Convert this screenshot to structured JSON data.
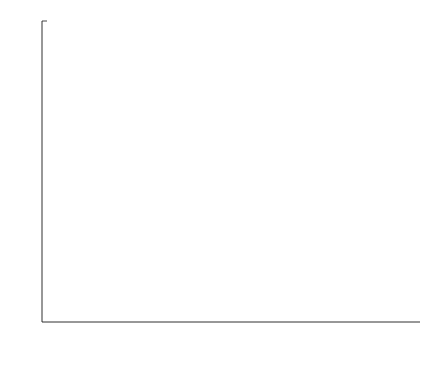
{
  "chart_data": {
    "type": "line",
    "title": "",
    "xlabel": "Signal-to-noise ratio Eb/N0",
    "ylabel": "Error rate",
    "xlim": [
      0,
      6
    ],
    "ylim": [
      1e-08,
      1
    ],
    "yscale": "log",
    "grid": false,
    "legend_position": "top-right",
    "xticks": [
      "0",
      "1",
      "2",
      "3",
      "4",
      "5",
      "6"
    ],
    "xtick_values": [
      0,
      1,
      2,
      3,
      4,
      5,
      6
    ],
    "yticks": [
      "10^0",
      "10^-1",
      "10^-2",
      "10^-3",
      "10^-4",
      "10^-5",
      "10^-6",
      "10^-7",
      "10^-8"
    ],
    "ytick_values": [
      1,
      0.1,
      0.01,
      0.001,
      0.0001,
      1e-05,
      1e-06,
      1e-07,
      1e-08
    ],
    "ytick_exponents": [
      "0",
      "-1",
      "-2",
      "-3",
      "-4",
      "-5",
      "-6",
      "-7",
      "-8"
    ],
    "series": [
      {
        "name": "Optimized irregular (frame error rate)",
        "legend": "Optimized irregular",
        "marker": "circle",
        "linestyle": "solid",
        "x": [
          0,
          0.5,
          1,
          2,
          3,
          4,
          5
        ],
        "values": [
          0.96,
          0.82,
          0.45,
          0.088,
          0.034,
          0.016,
          0.0068
        ]
      },
      {
        "name": "(3, 6)-regular (frame error rate)",
        "legend": "(3, 6)-regular",
        "marker": "plus",
        "linestyle": "solid",
        "x": [
          0,
          0.5,
          1,
          2,
          2.5,
          3,
          4,
          5
        ],
        "values": [
          0.97,
          0.85,
          0.62,
          0.017,
          0.00073,
          0.0003,
          0.00013,
          3.8e-05
        ]
      },
      {
        "name": "(3, 6)-regular (bit error rate)",
        "legend": "(3, 6)-regular",
        "marker": "plus",
        "linestyle": "dotted",
        "x": [
          0,
          0.5,
          1,
          2,
          2.5,
          3,
          4,
          5
        ],
        "values": [
          0.125,
          0.115,
          0.052,
          0.0011,
          2.3e-05,
          7.3e-07,
          2.9e-07,
          8e-08
        ]
      },
      {
        "name": "Optimized irregular (bit error rate)",
        "legend": "Optimized irregular",
        "marker": "circle",
        "linestyle": "dotted",
        "x": [
          0,
          0.5,
          1,
          2,
          3,
          4,
          5
        ],
        "values": [
          0.115,
          0.072,
          0.022,
          0.00057,
          0.000115,
          4.2e-05,
          1.6e-05
        ]
      }
    ],
    "legend_entries": [
      {
        "label": "Optimized irregular",
        "marker": "circle",
        "linestyle": "dotted"
      },
      {
        "label": "(3, 6)-regular",
        "marker": "plus",
        "linestyle": "dotted"
      }
    ]
  },
  "axis_text": {
    "xlabel_main": "Signal-to-noise ratio ",
    "xlabel_e": "E",
    "xlabel_b": "b",
    "xlabel_slash": "/",
    "xlabel_n": "N",
    "xlabel_0": "0",
    "ylabel": "Error rate",
    "exp_base": "10"
  },
  "colors": {
    "axis": "#1a1a1a",
    "solid_line": "#1a1a1a",
    "dotted_line": "#555555",
    "background": "#ffffff",
    "legend_border": "#555555"
  }
}
